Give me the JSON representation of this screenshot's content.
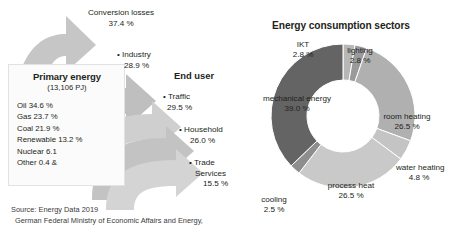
{
  "figure": {
    "source_lines": [
      "Source: Energy Data 2019",
      "German Federal Ministry of Economic Affairs and Energy,"
    ]
  },
  "left_diagram": {
    "panel": {
      "title": "Primary energy",
      "subtitle": "(13,106 PJ)",
      "items": [
        "Oil 34.6 %",
        "Gas 23.7 %",
        "Coal 21.9 %",
        "Renewable 13.2 %",
        "Nuclear 6.1",
        "Other 0.4 &"
      ]
    },
    "end_user_header": "End user",
    "flows": [
      {
        "name": "Conversion losses",
        "value": "37.4 %"
      },
      {
        "name": "• Industry",
        "value": "28.9 %"
      },
      {
        "name": "• Traffic",
        "value": "29.5 %"
      },
      {
        "name": "• Household",
        "value": "26.0 %"
      },
      {
        "name": "• Trade",
        "name2": "Services",
        "value": "15.5 %"
      }
    ]
  },
  "chart_data": {
    "type": "pie",
    "title": "Energy consumption sectors",
    "subtype": "donut",
    "categories": [
      "mechanical energy",
      "IKT",
      "lighting",
      "room heating",
      "water heating",
      "process heat",
      "cooling"
    ],
    "values": [
      39.0,
      2.8,
      2.8,
      26.5,
      4.8,
      26.5,
      2.5
    ],
    "labels": [
      "39.0 %",
      "2.8 %",
      "2.8 %",
      "26.5 %",
      "4.8 %",
      "26.5 %",
      "2.5 %"
    ],
    "colors": [
      "#646464",
      "#b7b7b7",
      "#9a9a9a",
      "#b0b0b0",
      "#c4c4c4",
      "#c9c9c9",
      "#8e8e8e"
    ],
    "legend": "none",
    "xlabel": "",
    "ylabel": ""
  }
}
